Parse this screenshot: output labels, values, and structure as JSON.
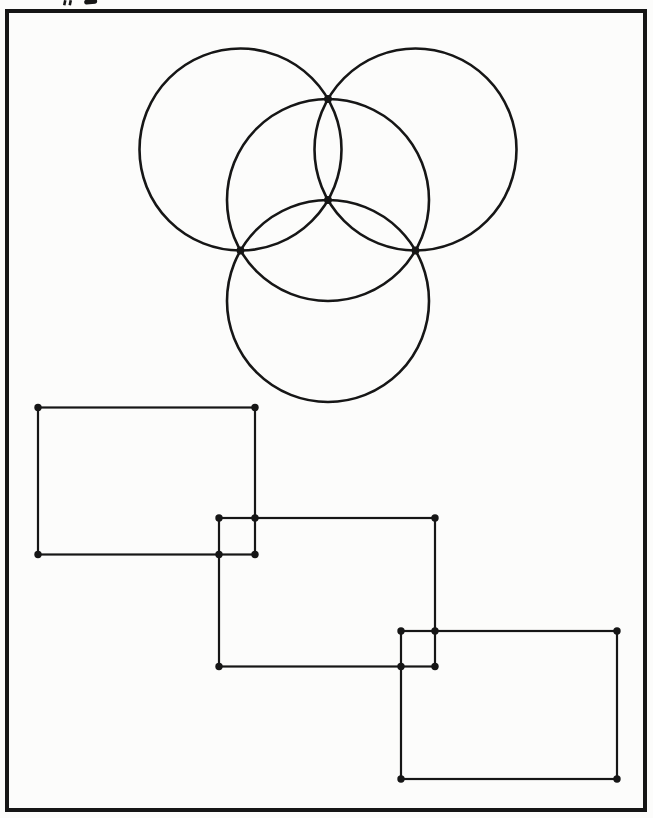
{
  "page": {
    "width": 653,
    "height": 818,
    "paper_color": "#fcfcfb",
    "ink_color": "#161616"
  },
  "frame": {
    "x": 7,
    "y": 11,
    "width": 638,
    "height": 799,
    "stroke_width": 4
  },
  "header_fragments": {
    "description": "cropped glyph remnants along the top edge of the scan",
    "ticks": [
      {
        "x": 64,
        "y": 0,
        "w": 2.6,
        "h": 5,
        "rotate": 12
      },
      {
        "x": 69.5,
        "y": 0,
        "w": 2.6,
        "h": 5,
        "rotate": 12
      }
    ],
    "blob": {
      "x": 84,
      "y": 0,
      "w": 13,
      "h": 4.6,
      "rotate": -5,
      "radius": 2.2
    }
  },
  "figure": {
    "type": "geometric-line-drawing",
    "circles": {
      "stroke_width": 2.6,
      "radius": 101,
      "items": [
        {
          "name": "top-left-circle",
          "cx": 240.5,
          "cy": 149.5
        },
        {
          "name": "top-right-circle",
          "cx": 415.5,
          "cy": 149.5
        },
        {
          "name": "bottom-circle",
          "cx": 328,
          "cy": 301
        },
        {
          "name": "center-circle",
          "cx": 328,
          "cy": 200
        }
      ],
      "intersection_dots": {
        "radius": 3.9,
        "points": [
          [
            328,
            99
          ],
          [
            240.5,
            250.5
          ],
          [
            415.5,
            250.5
          ],
          [
            328,
            200
          ]
        ]
      }
    },
    "rectangles": {
      "stroke_width": 2.2,
      "corner_dot_radius": 3.7,
      "items": [
        {
          "name": "left-rectangle",
          "x": 38,
          "y": 407.5,
          "width": 217,
          "height": 147
        },
        {
          "name": "middle-rectangle",
          "x": 219,
          "y": 518,
          "width": 216,
          "height": 148.5
        },
        {
          "name": "right-rectangle",
          "x": 401,
          "y": 631,
          "width": 216,
          "height": 148
        }
      ],
      "crossing_dots": [
        [
          255,
          518
        ],
        [
          219,
          554.5
        ],
        [
          435,
          631
        ],
        [
          401,
          666.5
        ]
      ]
    }
  }
}
